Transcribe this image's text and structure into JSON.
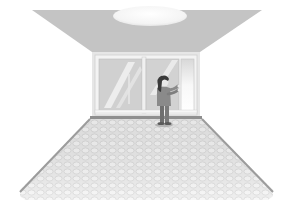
{
  "scene": {
    "description": "Illustrated room in perspective with a ceiling light, a back wall with windows, and a girl touching the window glass on a tiled floor",
    "colors": {
      "background": "#ffffff",
      "ceiling": "#c4c4c4",
      "ceiling_light": "#f7f7f7",
      "back_wall": "#e4e4e4",
      "window_frame": "#f2f2f2",
      "window_glass": "#d2d2d2",
      "window_shine": "#efefef",
      "baseboard": "#8f8f8f",
      "floor": "#ececec",
      "floor_tile": "#dadada",
      "floor_edge": "#9a9a9a",
      "figure_hair": "#3a3a3a",
      "figure_body": "#8a8a8a",
      "figure_skin": "#e8e8e8"
    },
    "elements": {
      "ceiling": "ceiling",
      "light": "ceiling-light",
      "wall": "back-wall",
      "windows": [
        "left-window-pane",
        "middle-window-pane",
        "right-narrow-pane"
      ],
      "figure": "girl-at-window",
      "floor": "tiled-floor"
    }
  }
}
